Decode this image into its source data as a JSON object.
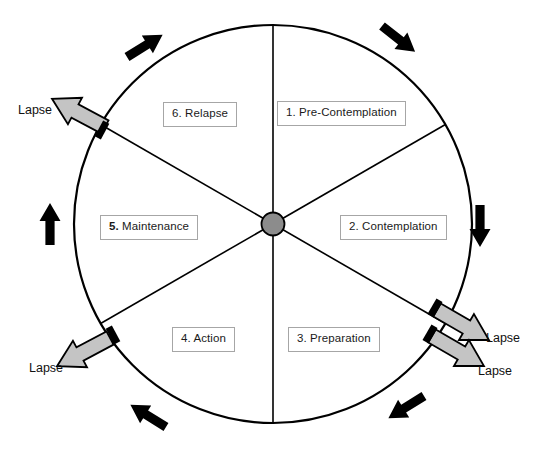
{
  "diagram": {
    "type": "cycle-wheel",
    "geometry": {
      "center_x": 273,
      "center_y": 224,
      "radius": 199,
      "segments": 6
    },
    "colors": {
      "outline": "#000000",
      "hub_fill": "#8c8c8c",
      "lapse_arrow_fill": "#bfbfbf",
      "label_border": "#a6a6a6",
      "label_text": "#1a1a1a",
      "background": "#ffffff"
    },
    "hub": {
      "name": "center-hub"
    }
  },
  "stages": [
    {
      "id": "pre-contemplation",
      "number": "1.",
      "label": "1. Pre-Contemplation",
      "bold_number": false,
      "position": {
        "left": 277,
        "top": 101
      }
    },
    {
      "id": "contemplation",
      "number": "2.",
      "label": "2. Contemplation",
      "bold_number": false,
      "position": {
        "left": 340,
        "top": 215
      }
    },
    {
      "id": "preparation",
      "number": "3.",
      "label": "3. Preparation",
      "bold_number": false,
      "position": {
        "left": 288,
        "top": 327
      }
    },
    {
      "id": "action",
      "number": "4.",
      "label": "4. Action",
      "bold_number": false,
      "position": {
        "left": 172,
        "top": 327
      }
    },
    {
      "id": "maintenance",
      "number": "5.",
      "label": "5. Maintenance",
      "bold_number": true,
      "position": {
        "left": 100,
        "top": 215
      }
    },
    {
      "id": "relapse",
      "number": "6.",
      "label": "6. Relapse",
      "bold_number": false,
      "position": {
        "left": 163,
        "top": 102
      }
    }
  ],
  "lapse_exits": [
    {
      "id": "lapse-upper-left",
      "label": "Lapse",
      "direction": "up-left",
      "label_position": {
        "left": 18,
        "top": 104
      }
    },
    {
      "id": "lapse-lower-left",
      "label": "Lapse",
      "direction": "down-left",
      "label_position": {
        "left": 29,
        "top": 362
      }
    },
    {
      "id": "lapse-right-upper",
      "label": "Lapse",
      "direction": "down-right",
      "label_position": {
        "left": 486,
        "top": 332
      }
    },
    {
      "id": "lapse-right-lower",
      "label": "Lapse",
      "direction": "down-right",
      "label_position": {
        "left": 478,
        "top": 365
      }
    }
  ],
  "flow_arrows": [
    {
      "id": "flow-arrow-top-left",
      "direction": "up-right"
    },
    {
      "id": "flow-arrow-top-right",
      "direction": "down-right"
    },
    {
      "id": "flow-arrow-right",
      "direction": "down"
    },
    {
      "id": "flow-arrow-bottom-right",
      "direction": "down-left"
    },
    {
      "id": "flow-arrow-bottom-left",
      "direction": "up-left"
    },
    {
      "id": "flow-arrow-left",
      "direction": "up"
    }
  ]
}
